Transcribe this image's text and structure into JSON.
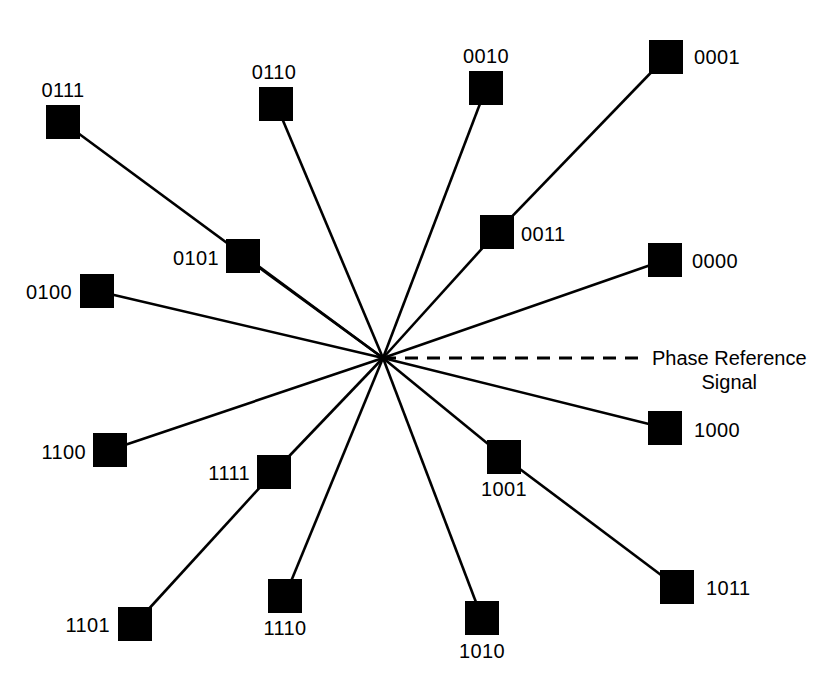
{
  "figure": {
    "background_color": "#ffffff",
    "ink_color": "#000000",
    "width": 837,
    "height": 687
  },
  "annotation": {
    "phase_reference_line1": "Phase Reference",
    "phase_reference_line2": "Signal"
  },
  "chart_data": {
    "type": "scatter",
    "xlabel": "",
    "ylabel": "",
    "origin": {
      "x": 383,
      "y": 358
    },
    "marker": {
      "shape": "square",
      "fill": "#000000",
      "size_px": 34
    },
    "reference_axis": {
      "name": "Phase Reference Signal",
      "style": "dashed",
      "from": {
        "x": 383,
        "y": 358
      },
      "to": {
        "x": 640,
        "y": 358
      },
      "angle_deg": 0
    },
    "points": [
      {
        "code": "0111",
        "x": 63,
        "y": 122,
        "label_pos": "above",
        "label_x": 63,
        "label_y": 100,
        "vector_via": null,
        "angle_deg": 135.0
      },
      {
        "code": "0110",
        "x": 276,
        "y": 104,
        "label_pos": "above",
        "label_x": 274,
        "label_y": 82,
        "vector_via": null,
        "angle_deg": 112.5
      },
      {
        "code": "0010",
        "x": 486,
        "y": 88,
        "label_pos": "above",
        "label_x": 486,
        "label_y": 66,
        "vector_via": null,
        "angle_deg": 78.8
      },
      {
        "code": "0001",
        "x": 666,
        "y": 57,
        "label_pos": "right",
        "label_x": 694,
        "label_y": 57,
        "vector_via": "0011",
        "angle_deg": 45.0
      },
      {
        "code": "0011",
        "x": 497,
        "y": 232,
        "label_pos": "right",
        "label_x": 521,
        "label_y": 234,
        "vector_via": null,
        "angle_deg": 56.3
      },
      {
        "code": "0000",
        "x": 665,
        "y": 260,
        "label_pos": "right",
        "label_x": 692,
        "label_y": 261,
        "vector_via": null,
        "angle_deg": 22.5
      },
      {
        "code": "0101",
        "x": 243,
        "y": 256,
        "label_pos": "left",
        "label_x": 219,
        "label_y": 258,
        "vector_via": null,
        "angle_deg": 146.3
      },
      {
        "code": "0100",
        "x": 97,
        "y": 291,
        "label_pos": "left",
        "label_x": 72,
        "label_y": 292,
        "vector_via": null,
        "angle_deg": 168.8
      },
      {
        "code": "1100",
        "x": 110,
        "y": 450,
        "label_pos": "left",
        "label_x": 86,
        "label_y": 452,
        "vector_via": null,
        "angle_deg": 191.3
      },
      {
        "code": "1111",
        "x": 274,
        "y": 472,
        "label_pos": "left",
        "label_x": 250,
        "label_y": 473,
        "vector_via": null,
        "angle_deg": 225.0
      },
      {
        "code": "1101",
        "x": 135,
        "y": 624,
        "label_pos": "left",
        "label_x": 110,
        "label_y": 625,
        "vector_via": "1111",
        "angle_deg": 213.8
      },
      {
        "code": "1110",
        "x": 285,
        "y": 596,
        "label_pos": "below",
        "label_x": 285,
        "label_y": 618,
        "vector_via": null,
        "angle_deg": 247.5
      },
      {
        "code": "1010",
        "x": 482,
        "y": 618,
        "label_pos": "below",
        "label_x": 482,
        "label_y": 641,
        "vector_via": null,
        "angle_deg": 281.3
      },
      {
        "code": "1001",
        "x": 504,
        "y": 457,
        "label_pos": "below",
        "label_x": 504,
        "label_y": 479,
        "vector_via": null,
        "angle_deg": 303.8
      },
      {
        "code": "1011",
        "x": 677,
        "y": 587,
        "label_pos": "right",
        "label_x": 706,
        "label_y": 588,
        "vector_via": "1001",
        "angle_deg": 315.0
      },
      {
        "code": "1000",
        "x": 665,
        "y": 428,
        "label_pos": "right",
        "label_x": 694,
        "label_y": 430,
        "vector_via": null,
        "angle_deg": 337.5
      }
    ]
  }
}
